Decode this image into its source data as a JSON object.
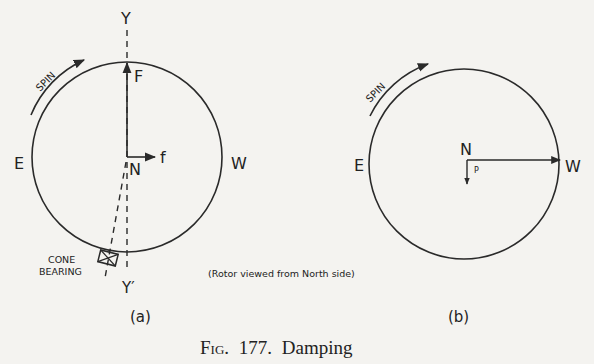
{
  "figure": {
    "caption_prefix": "Fig.",
    "caption_number": "177.",
    "caption_title": "Damping",
    "note": "(Rotor viewed from North side)"
  },
  "panel_a": {
    "label": "(a)",
    "spin_label": "SPIN",
    "axis_top": "Y",
    "axis_bottom": "Y′",
    "force_label": "F",
    "small_force_label": "f",
    "center_label": "N",
    "left_label": "E",
    "right_label": "W",
    "bearing_label_1": "CONE",
    "bearing_label_2": "BEARING"
  },
  "panel_b": {
    "label": "(b)",
    "spin_label": "SPIN",
    "center_label": "N",
    "left_label": "E",
    "right_label": "W",
    "small_arrow_label": "P"
  },
  "colors": {
    "ink": "#222222",
    "paper": "#f4f3f0"
  }
}
